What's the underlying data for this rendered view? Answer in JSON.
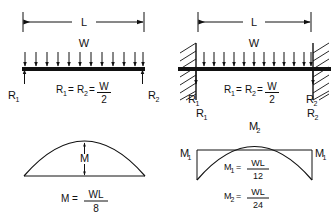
{
  "figure": {
    "type": "engineering-beam-diagram",
    "ink_color": "#111111",
    "background_color": "#ffffff"
  },
  "simple_beam": {
    "span_label": "L",
    "load_label": "W",
    "reaction_left_label": "R",
    "reaction_left_sub": "1",
    "reaction_right_label": "R",
    "reaction_right_sub": "2",
    "reaction_formula": {
      "term1": "R",
      "term1_sub": "1",
      "eq1": "=",
      "term2": "R",
      "term2_sub": "2",
      "eq2": "=",
      "numerator": "W",
      "denominator": "2"
    },
    "load_arrow_count": 12,
    "support_type": "pinned-triangles"
  },
  "fixed_beam": {
    "span_label": "L",
    "load_label": "W",
    "reaction_left_label": "R",
    "reaction_left_sub": "1",
    "reaction_right_label": "R",
    "reaction_right_sub": "2",
    "reaction_formula": {
      "term1": "R",
      "term1_sub": "1",
      "eq1": "=",
      "term2": "R",
      "term2_sub": "2",
      "eq2": "=",
      "numerator": "W",
      "denominator": "2"
    },
    "load_arrow_count": 12,
    "support_type": "fixed-hatched-walls"
  },
  "simple_moment_diagram": {
    "peak_label": "M",
    "formula": {
      "lhs": "M",
      "eq": "=",
      "numerator": "WL",
      "denominator": "8"
    }
  },
  "fixed_moment_diagram": {
    "reaction_left_label": "R",
    "reaction_left_sub": "1",
    "reaction_right_label": "R",
    "reaction_right_sub": "2",
    "peak_label": "M",
    "peak_sub": "2",
    "end_left_label": "M",
    "end_left_sub": "1",
    "end_right_label": "M",
    "end_right_sub": "1",
    "formula_m1": {
      "lhs": "M",
      "lhs_sub": "1",
      "eq": "=",
      "numerator": "WL",
      "denominator": "12"
    },
    "formula_m2": {
      "lhs": "M",
      "lhs_sub": "2",
      "eq": "=",
      "numerator": "WL",
      "denominator": "24"
    }
  }
}
